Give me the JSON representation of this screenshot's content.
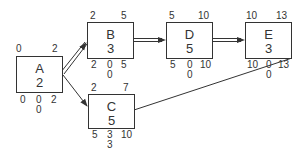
{
  "diagram": {
    "type": "activity-on-node network",
    "nodes": [
      {
        "id": "A",
        "name": "A",
        "duration": "2",
        "es": "0",
        "ef": "2",
        "ls": "0",
        "tf": "0",
        "lf": "2",
        "ff": "0",
        "critical": true
      },
      {
        "id": "B",
        "name": "B",
        "duration": "3",
        "es": "2",
        "ef": "5",
        "ls": "2",
        "tf": "0",
        "lf": "5",
        "ff": "0",
        "critical": true
      },
      {
        "id": "C",
        "name": "C",
        "duration": "5",
        "es": "2",
        "ef": "7",
        "ls": "5",
        "tf": "3",
        "lf": "10",
        "ff": "3",
        "critical": false
      },
      {
        "id": "D",
        "name": "D",
        "duration": "5",
        "es": "5",
        "ef": "10",
        "ls": "5",
        "tf": "0",
        "lf": "10",
        "ff": "0",
        "critical": true
      },
      {
        "id": "E",
        "name": "E",
        "duration": "3",
        "es": "10",
        "ef": "13",
        "ls": "10",
        "tf": "0",
        "lf": "13",
        "ff": "0",
        "critical": true
      }
    ],
    "edges": [
      {
        "from": "A",
        "to": "B",
        "critical": true
      },
      {
        "from": "A",
        "to": "C",
        "critical": false
      },
      {
        "from": "B",
        "to": "D",
        "critical": true
      },
      {
        "from": "D",
        "to": "E",
        "critical": true
      },
      {
        "from": "C",
        "to": "E",
        "critical": false
      }
    ],
    "colors": {
      "line": "#333333",
      "background": "#ffffff"
    }
  }
}
